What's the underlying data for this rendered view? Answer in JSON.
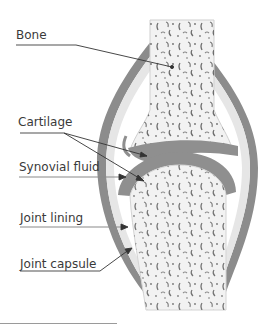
{
  "diagram": {
    "labels": [
      {
        "id": "bone",
        "text": "Bone",
        "x": 16,
        "y": 28
      },
      {
        "id": "cartilage",
        "text": "Cartilage",
        "x": 18,
        "y": 115
      },
      {
        "id": "synovial_fluid",
        "text": "Synovial fluid",
        "x": 19,
        "y": 160
      },
      {
        "id": "joint_lining",
        "text": "Joint lining",
        "x": 20,
        "y": 211
      },
      {
        "id": "joint_capsule",
        "text": "Joint capsule",
        "x": 20,
        "y": 257
      }
    ],
    "colors": {
      "capsule": "#8c8c8c",
      "cartilage": "#8f8f8f",
      "lining": "#e6e6e6",
      "bone_fill": "#f2f2f2",
      "bone_pores": "#555555",
      "leader_lines": "#333333",
      "label_underline": "#8a8a8a",
      "text": "#3a3a3a"
    }
  }
}
